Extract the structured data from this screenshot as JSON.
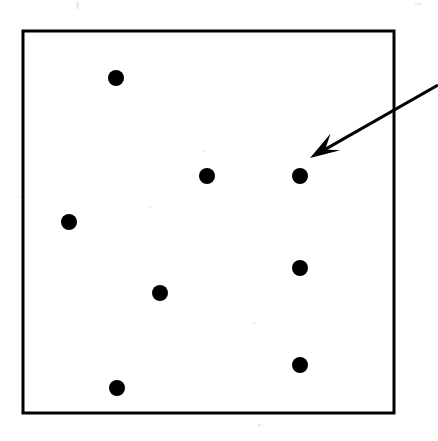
{
  "figure": {
    "title": "",
    "caption": "",
    "background_color": "#ffffff",
    "ink_color": "#000000",
    "width": 438,
    "height": 441
  },
  "frame": {
    "name": "plot-boundary-rectangle",
    "x": 23,
    "y": 31,
    "width": 371,
    "height": 382,
    "stroke_color": "#000000",
    "stroke_width": 3,
    "fill": "none"
  },
  "chart_data": {
    "type": "scatter",
    "title": "",
    "xlabel": "",
    "ylabel": "",
    "grid": false,
    "legend": false,
    "xlim": [
      23,
      394
    ],
    "ylim": [
      31,
      413
    ],
    "axis_ticks": {
      "x": [],
      "y": []
    },
    "marker": {
      "shape": "circle",
      "color": "#000000",
      "radius_px": 8,
      "filled": true
    },
    "point_count": 8,
    "series": [
      {
        "name": "points",
        "color": "#000000",
        "points": [
          {
            "id": "p1",
            "label": "",
            "x": 116,
            "y": 78,
            "r": 8
          },
          {
            "id": "p2",
            "label": "",
            "x": 207,
            "y": 176,
            "r": 8
          },
          {
            "id": "p3",
            "label": "",
            "x": 300,
            "y": 176,
            "r": 8,
            "annotated": true
          },
          {
            "id": "p4",
            "label": "",
            "x": 69,
            "y": 222,
            "r": 8
          },
          {
            "id": "p5",
            "label": "",
            "x": 300,
            "y": 268,
            "r": 8
          },
          {
            "id": "p6",
            "label": "",
            "x": 160,
            "y": 293,
            "r": 8
          },
          {
            "id": "p7",
            "label": "",
            "x": 300,
            "y": 365,
            "r": 8
          },
          {
            "id": "p8",
            "label": "",
            "x": 117,
            "y": 388,
            "r": 8
          }
        ]
      }
    ]
  },
  "annotation": {
    "name": "pointer-arrow",
    "label": "",
    "target_point_id": "p3",
    "stroke_color": "#000000",
    "stroke_width": 3,
    "tail_x": 438,
    "tail_y": 85,
    "tip_x": 310,
    "tip_y": 158,
    "head_length": 30,
    "head_half_width": 11
  },
  "artifacts": {
    "name": "scan-specks",
    "visible": true,
    "items": [
      {
        "x": 76,
        "y": 2,
        "w": 3,
        "h": 7
      },
      {
        "x": 415,
        "y": 3,
        "w": 7,
        "h": 2
      },
      {
        "x": 149,
        "y": 206,
        "w": 2,
        "h": 2
      },
      {
        "x": 203,
        "y": 150,
        "w": 2,
        "h": 2
      },
      {
        "x": 253,
        "y": 322,
        "w": 2,
        "h": 2
      },
      {
        "x": 258,
        "y": 424,
        "w": 3,
        "h": 3
      },
      {
        "x": 18,
        "y": 196,
        "w": 2,
        "h": 2
      }
    ]
  }
}
